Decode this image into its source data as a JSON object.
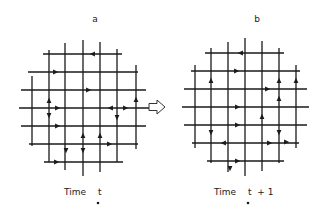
{
  "figure": {
    "transition_arrow_icon": "hollow-right-arrow",
    "colors": {
      "ink": "#1a1a1a",
      "background": "#ffffff"
    },
    "panels": [
      {
        "id": "a",
        "title": "a",
        "title_pos": [
          95,
          22
        ],
        "caption_prefix": "Time",
        "caption_var": "t",
        "caption_suffix": "",
        "caption_pos": [
          64,
          195
        ],
        "vertical_lines": [
          {
            "x": 32,
            "y1": 76,
            "y2": 146
          },
          {
            "x": 49,
            "y1": 50,
            "y2": 162
          },
          {
            "x": 65,
            "y1": 43,
            "y2": 170
          },
          {
            "x": 83,
            "y1": 40,
            "y2": 176
          },
          {
            "x": 100,
            "y1": 42,
            "y2": 172
          },
          {
            "x": 117,
            "y1": 49,
            "y2": 162
          },
          {
            "x": 136,
            "y1": 65,
            "y2": 149
          }
        ],
        "horizontal_lines": [
          {
            "y": 54,
            "x1": 43,
            "x2": 122
          },
          {
            "y": 72,
            "x1": 28,
            "x2": 138
          },
          {
            "y": 90,
            "x1": 21,
            "x2": 146
          },
          {
            "y": 108,
            "x1": 19,
            "x2": 149
          },
          {
            "y": 126,
            "x1": 21,
            "x2": 146
          },
          {
            "y": 144,
            "x1": 29,
            "x2": 138
          },
          {
            "y": 162,
            "x1": 44,
            "x2": 123
          }
        ],
        "particles": [
          {
            "x": 93,
            "y": 54,
            "dir": "left"
          },
          {
            "x": 55,
            "y": 72,
            "dir": "right"
          },
          {
            "x": 88,
            "y": 90,
            "dir": "right"
          },
          {
            "x": 49,
            "y": 101,
            "dir": "up"
          },
          {
            "x": 57,
            "y": 108,
            "dir": "right"
          },
          {
            "x": 49,
            "y": 115,
            "dir": "down"
          },
          {
            "x": 111,
            "y": 108,
            "dir": "left"
          },
          {
            "x": 125,
            "y": 108,
            "dir": "right"
          },
          {
            "x": 136,
            "y": 100,
            "dir": "up"
          },
          {
            "x": 117,
            "y": 117,
            "dir": "down"
          },
          {
            "x": 57,
            "y": 126,
            "dir": "right"
          },
          {
            "x": 83,
            "y": 136,
            "dir": "up"
          },
          {
            "x": 100,
            "y": 136,
            "dir": "up"
          },
          {
            "x": 109,
            "y": 144,
            "dir": "right"
          },
          {
            "x": 66,
            "y": 150,
            "dir": "down"
          },
          {
            "x": 83,
            "y": 150,
            "dir": "down"
          },
          {
            "x": 56,
            "y": 162,
            "dir": "right"
          }
        ]
      },
      {
        "id": "b",
        "title": "b",
        "title_pos": [
          257,
          22
        ],
        "caption_prefix": "Time",
        "caption_var": "t",
        "caption_suffix": "+ 1",
        "caption_pos": [
          214,
          195
        ],
        "vertical_lines": [
          {
            "x": 195,
            "y1": 65,
            "y2": 148
          },
          {
            "x": 211,
            "y1": 48,
            "y2": 163
          },
          {
            "x": 228,
            "y1": 42,
            "y2": 172
          },
          {
            "x": 245,
            "y1": 38,
            "y2": 176
          },
          {
            "x": 262,
            "y1": 41,
            "y2": 171
          },
          {
            "x": 279,
            "y1": 48,
            "y2": 163
          },
          {
            "x": 296,
            "y1": 65,
            "y2": 148
          }
        ],
        "horizontal_lines": [
          {
            "y": 53,
            "x1": 205,
            "x2": 284
          },
          {
            "y": 71,
            "x1": 191,
            "x2": 300
          },
          {
            "y": 89,
            "x1": 184,
            "x2": 307
          },
          {
            "y": 107,
            "x1": 182,
            "x2": 309
          },
          {
            "y": 125,
            "x1": 184,
            "x2": 307
          },
          {
            "y": 143,
            "x1": 192,
            "x2": 299
          },
          {
            "y": 161,
            "x1": 207,
            "x2": 284
          }
        ],
        "particles": [
          {
            "x": 241,
            "y": 53,
            "dir": "left"
          },
          {
            "x": 236,
            "y": 71,
            "dir": "right"
          },
          {
            "x": 211,
            "y": 81,
            "dir": "up"
          },
          {
            "x": 279,
            "y": 81,
            "dir": "up"
          },
          {
            "x": 296,
            "y": 81,
            "dir": "up"
          },
          {
            "x": 267,
            "y": 89,
            "dir": "right"
          },
          {
            "x": 279,
            "y": 99,
            "dir": "up"
          },
          {
            "x": 237,
            "y": 107,
            "dir": "right"
          },
          {
            "x": 262,
            "y": 117,
            "dir": "up"
          },
          {
            "x": 237,
            "y": 125,
            "dir": "right"
          },
          {
            "x": 211,
            "y": 132,
            "dir": "down"
          },
          {
            "x": 279,
            "y": 132,
            "dir": "down"
          },
          {
            "x": 224,
            "y": 143,
            "dir": "left"
          },
          {
            "x": 269,
            "y": 143,
            "dir": "right"
          },
          {
            "x": 286,
            "y": 142,
            "dir": "right"
          },
          {
            "x": 237,
            "y": 161,
            "dir": "right"
          },
          {
            "x": 230,
            "y": 168,
            "dir": "down"
          }
        ]
      }
    ],
    "transition_arrow": {
      "x": 157,
      "y": 107
    }
  }
}
